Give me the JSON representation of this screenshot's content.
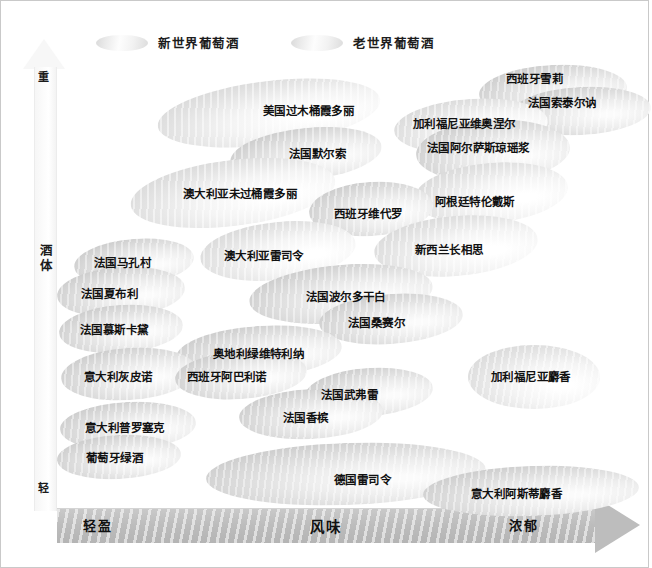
{
  "legend": {
    "items": [
      {
        "label": "新世界葡萄酒",
        "kind": "new",
        "x": 0
      },
      {
        "label": "老世界葡萄酒",
        "kind": "old",
        "x": 195
      }
    ]
  },
  "axes": {
    "y": {
      "top_label": "重",
      "title": "酒体",
      "bottom_label": "轻"
    },
    "x": {
      "left_label": "轻盈",
      "title": "风味",
      "right_label": "浓郁"
    }
  },
  "chart_data": {
    "type": "scatter",
    "title": "",
    "xlabel": "风味",
    "ylabel": "酒体",
    "xlim": [
      0,
      100
    ],
    "ylim": [
      0,
      100
    ],
    "xtick_labels": [
      "轻盈",
      "浓郁"
    ],
    "ytick_labels": [
      "轻",
      "重"
    ],
    "grid": false,
    "legend_position": "top",
    "legend": [
      "新世界葡萄酒",
      "老世界葡萄酒"
    ],
    "note": "气泡位置以像素坐标给出（ellipse 中心 cx,cy 与半径 rx,ry），风味沿 x 轴增加，酒体沿 y 轴向上增加",
    "points": [
      {
        "label": "西班牙雪莉",
        "kind": "old",
        "cx": 552,
        "cy": 90,
        "rx": 74,
        "ry": 26,
        "rot": -3,
        "tx": 505,
        "ty": 73
      },
      {
        "label": "法国索泰尔讷",
        "kind": "old",
        "cx": 580,
        "cy": 110,
        "rx": 70,
        "ry": 24,
        "rot": -3,
        "tx": 527,
        "ty": 97
      },
      {
        "label": "美国过木桶霞多丽",
        "kind": "new",
        "cx": 268,
        "cy": 112,
        "rx": 112,
        "ry": 32,
        "rot": -7,
        "tx": 262,
        "ty": 105
      },
      {
        "label": "加利福尼亚维奥涅尔",
        "kind": "new",
        "cx": 470,
        "cy": 125,
        "rx": 77,
        "ry": 27,
        "rot": -4,
        "tx": 412,
        "ty": 118
      },
      {
        "label": "法国阿尔萨斯琼瑶浆",
        "kind": "old",
        "cx": 492,
        "cy": 150,
        "rx": 77,
        "ry": 31,
        "rot": -3,
        "tx": 426,
        "ty": 142
      },
      {
        "label": "法国默尔索",
        "kind": "old",
        "cx": 305,
        "cy": 153,
        "rx": 76,
        "ry": 26,
        "rot": -6,
        "tx": 288,
        "ty": 148
      },
      {
        "label": "澳大利亚未过桶霞多丽",
        "kind": "new",
        "cx": 232,
        "cy": 192,
        "rx": 103,
        "ry": 33,
        "rot": -7,
        "tx": 182,
        "ty": 188
      },
      {
        "label": "阿根廷特伦戴斯",
        "kind": "new",
        "cx": 490,
        "cy": 192,
        "rx": 77,
        "ry": 30,
        "rot": -5,
        "tx": 434,
        "ty": 196
      },
      {
        "label": "西班牙维代罗",
        "kind": "old",
        "cx": 370,
        "cy": 208,
        "rx": 62,
        "ry": 27,
        "rot": -4,
        "tx": 333,
        "ty": 208
      },
      {
        "label": "澳大利亚雷司令",
        "kind": "new",
        "cx": 277,
        "cy": 250,
        "rx": 78,
        "ry": 29,
        "rot": -6,
        "tx": 223,
        "ty": 250
      },
      {
        "label": "新西兰长相思",
        "kind": "new",
        "cx": 455,
        "cy": 245,
        "rx": 82,
        "ry": 30,
        "rot": -5,
        "tx": 414,
        "ty": 244
      },
      {
        "label": "法国马孔村",
        "kind": "old",
        "cx": 133,
        "cy": 261,
        "rx": 60,
        "ry": 23,
        "rot": -5,
        "tx": 93,
        "ty": 257
      },
      {
        "label": "法国夏布利",
        "kind": "old",
        "cx": 120,
        "cy": 291,
        "rx": 64,
        "ry": 25,
        "rot": -4,
        "tx": 80,
        "ty": 288
      },
      {
        "label": "法国波尔多干白",
        "kind": "old",
        "cx": 340,
        "cy": 293,
        "rx": 92,
        "ry": 29,
        "rot": -5,
        "tx": 305,
        "ty": 291
      },
      {
        "label": "法国桑赛尔",
        "kind": "old",
        "cx": 390,
        "cy": 318,
        "rx": 72,
        "ry": 25,
        "rot": -4,
        "tx": 347,
        "ty": 317
      },
      {
        "label": "法国慕斯卡黛",
        "kind": "old",
        "cx": 120,
        "cy": 328,
        "rx": 62,
        "ry": 24,
        "rot": -4,
        "tx": 79,
        "ty": 324
      },
      {
        "label": "奥地利绿维特利纳",
        "kind": "old",
        "cx": 258,
        "cy": 351,
        "rx": 83,
        "ry": 26,
        "rot": -4,
        "tx": 212,
        "ty": 348
      },
      {
        "label": "意大利灰皮诺",
        "kind": "old",
        "cx": 128,
        "cy": 373,
        "rx": 68,
        "ry": 26,
        "rot": -4,
        "tx": 83,
        "ty": 371
      },
      {
        "label": "西班牙阿巴利诺",
        "kind": "old",
        "cx": 240,
        "cy": 374,
        "rx": 66,
        "ry": 24,
        "rot": -4,
        "tx": 186,
        "ty": 371
      },
      {
        "label": "加利福尼亚麝香",
        "kind": "new",
        "cx": 533,
        "cy": 376,
        "rx": 66,
        "ry": 32,
        "rot": 0,
        "tx": 490,
        "ty": 371
      },
      {
        "label": "法国武弗雷",
        "kind": "old",
        "cx": 368,
        "cy": 391,
        "rx": 64,
        "ry": 24,
        "rot": -4,
        "tx": 320,
        "ty": 389
      },
      {
        "label": "意大利普罗塞克",
        "kind": "old",
        "cx": 127,
        "cy": 425,
        "rx": 68,
        "ry": 24,
        "rot": -3,
        "tx": 84,
        "ty": 422
      },
      {
        "label": "法国香槟",
        "kind": "old",
        "cx": 310,
        "cy": 413,
        "rx": 72,
        "ry": 25,
        "rot": -3,
        "tx": 282,
        "ty": 412
      },
      {
        "label": "葡萄牙绿酒",
        "kind": "old",
        "cx": 118,
        "cy": 456,
        "rx": 62,
        "ry": 22,
        "rot": -3,
        "tx": 85,
        "ty": 452
      },
      {
        "label": "德国雷司令",
        "kind": "old",
        "cx": 345,
        "cy": 473,
        "rx": 140,
        "ry": 31,
        "rot": -2,
        "tx": 333,
        "ty": 474
      },
      {
        "label": "意大利阿斯蒂麝香",
        "kind": "old",
        "cx": 530,
        "cy": 490,
        "rx": 108,
        "ry": 25,
        "rot": -2,
        "tx": 470,
        "ty": 488
      }
    ]
  }
}
